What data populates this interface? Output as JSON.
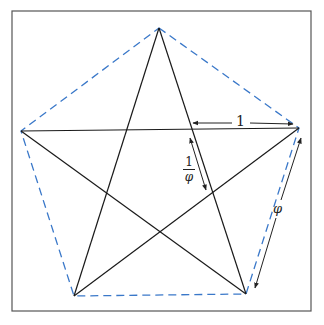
{
  "diagram": {
    "colors": {
      "frame": "#555555",
      "star": "#1a1a1a",
      "pentagon": "#3a78c9",
      "arrow": "#222222"
    },
    "labels": {
      "side_top": "1",
      "segment_numerator": "1",
      "segment_denominator": "φ",
      "side_right": "φ"
    }
  }
}
